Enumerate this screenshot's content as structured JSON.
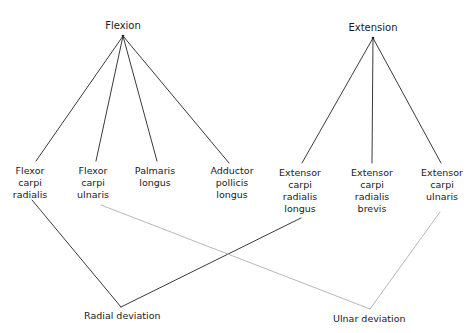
{
  "diagram": {
    "type": "wrist-muscle-action-diagram",
    "actions": {
      "flexion": {
        "label": "Flexion",
        "x": 123,
        "y": 35
      },
      "extension": {
        "label": "Extension",
        "x": 373,
        "y": 37
      },
      "radial_deviation": {
        "label": "Radial deviation",
        "x": 121,
        "y": 307
      },
      "ulnar_deviation": {
        "label": "Ulnar deviation",
        "x": 370,
        "y": 309
      }
    },
    "muscles": [
      {
        "id": "fcr",
        "label": "Flexor\ncarpi\nradialis",
        "x": 30,
        "y": 165
      },
      {
        "id": "fcu",
        "label": "Flexor\ncarpi\nulnaris",
        "x": 93,
        "y": 165
      },
      {
        "id": "pl",
        "label": "Palmaris\nlongus",
        "x": 155,
        "y": 165
      },
      {
        "id": "apl",
        "label": "Adductor\npollicis\nlongus",
        "x": 232,
        "y": 165
      },
      {
        "id": "ecrl",
        "label": "Extensor\ncarpi\nradialis\nlongus",
        "x": 300,
        "y": 167
      },
      {
        "id": "ecrb",
        "label": "Extensor\ncarpi\nradialis\nbrevis",
        "x": 372,
        "y": 167
      },
      {
        "id": "ecu",
        "label": "Extensor\ncarpi\nulnaris",
        "x": 442,
        "y": 167
      }
    ],
    "edges": [
      {
        "from": "flexion",
        "to": "fcr",
        "x1": 123,
        "y1": 36,
        "x2": 36,
        "y2": 161,
        "style": "dark"
      },
      {
        "from": "flexion",
        "to": "fcu",
        "x1": 123,
        "y1": 36,
        "x2": 96,
        "y2": 161,
        "style": "dark"
      },
      {
        "from": "flexion",
        "to": "pl",
        "x1": 123,
        "y1": 36,
        "x2": 157,
        "y2": 161,
        "style": "dark"
      },
      {
        "from": "flexion",
        "to": "apl",
        "x1": 123,
        "y1": 36,
        "x2": 229,
        "y2": 163,
        "style": "dark"
      },
      {
        "from": "extension",
        "to": "ecrl",
        "x1": 373,
        "y1": 38,
        "x2": 302,
        "y2": 163,
        "style": "dark"
      },
      {
        "from": "extension",
        "to": "ecrb",
        "x1": 373,
        "y1": 38,
        "x2": 372,
        "y2": 163,
        "style": "dark"
      },
      {
        "from": "extension",
        "to": "ecu",
        "x1": 373,
        "y1": 38,
        "x2": 441,
        "y2": 163,
        "style": "dark"
      },
      {
        "from": "fcr",
        "to": "radial_deviation",
        "x1": 32,
        "y1": 200,
        "x2": 121,
        "y2": 307,
        "style": "dark"
      },
      {
        "from": "ecrl",
        "to": "radial_deviation",
        "x1": 301,
        "y1": 218,
        "x2": 121,
        "y2": 307,
        "style": "dark"
      },
      {
        "from": "fcu",
        "to": "ulnar_deviation",
        "x1": 101,
        "y1": 205,
        "x2": 370,
        "y2": 309,
        "style": "light"
      },
      {
        "from": "ecu",
        "to": "ulnar_deviation",
        "x1": 440,
        "y1": 212,
        "x2": 370,
        "y2": 309,
        "style": "light"
      }
    ],
    "colors": {
      "dark_line": "#3a3a3a",
      "light_line": "#b8b8b8",
      "text": "#1a1a1a",
      "background": "#ffffff"
    }
  }
}
